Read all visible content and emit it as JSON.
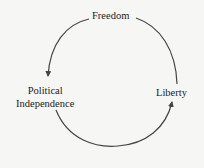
{
  "diagram": {
    "type": "cycle",
    "nodes": [
      {
        "id": "freedom",
        "label": "Freedom"
      },
      {
        "id": "liberty",
        "label": "Liberty"
      },
      {
        "id": "political",
        "label_line1": "Political",
        "label_line2": "Independence"
      }
    ],
    "edges": [
      {
        "from": "freedom",
        "to": "political"
      },
      {
        "from": "political",
        "to": "liberty"
      },
      {
        "from": "freedom",
        "to": "liberty"
      }
    ],
    "colors": {
      "line": "#444444",
      "text": "#222222",
      "background": "#f6f6f4"
    }
  }
}
